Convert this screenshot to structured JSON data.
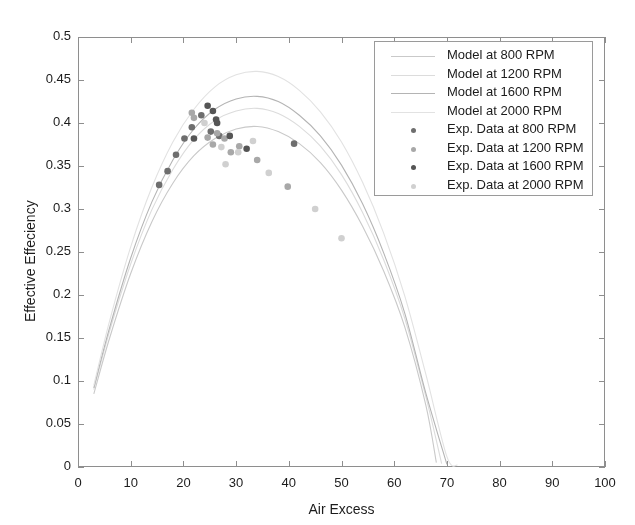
{
  "chart_data": {
    "type": "scatter",
    "title": "",
    "xlabel": "Air Excess",
    "ylabel": "Effective Effeciency",
    "xlim": [
      0,
      100
    ],
    "ylim": [
      0,
      0.5
    ],
    "grid": false,
    "xticks": [
      "0",
      "10",
      "20",
      "30",
      "40",
      "50",
      "60",
      "70",
      "80",
      "90",
      "100"
    ],
    "xtick_values": [
      0,
      10,
      20,
      30,
      40,
      50,
      60,
      70,
      80,
      90,
      100
    ],
    "yticks": [
      "0",
      "0.05",
      "0.1",
      "0.15",
      "0.2",
      "0.25",
      "0.3",
      "0.35",
      "0.4",
      "0.45",
      "0.5"
    ],
    "ytick_values": [
      0,
      0.05,
      0.1,
      0.15,
      0.2,
      0.25,
      0.3,
      0.35,
      0.4,
      0.45,
      0.5
    ],
    "legend_position": "top-right",
    "legend": [
      {
        "label": "Model at 800 RPM",
        "kind": "line",
        "color": "#c9c9c9"
      },
      {
        "label": "Model at 1200 RPM",
        "kind": "line",
        "color": "#dcdcdc"
      },
      {
        "label": "Model at 1600 RPM",
        "kind": "line",
        "color": "#b4b4b4"
      },
      {
        "label": "Model at 2000 RPM",
        "kind": "line",
        "color": "#e2e2e2"
      },
      {
        "label": "Exp. Data at 800 RPM",
        "kind": "marker",
        "color": "#6e6e6e"
      },
      {
        "label": "Exp. Data at 1200 RPM",
        "kind": "marker",
        "color": "#a8a8a8"
      },
      {
        "label": "Exp. Data at 1600 RPM",
        "kind": "marker",
        "color": "#555555"
      },
      {
        "label": "Exp. Data at 2000 RPM",
        "kind": "marker",
        "color": "#d0d0d0"
      }
    ],
    "series": [
      {
        "name": "Model at 800 RPM",
        "kind": "line",
        "color": "#c9c9c9",
        "x": [
          3,
          6,
          10,
          14,
          18,
          22,
          26,
          30,
          34,
          38,
          42,
          46,
          50,
          54,
          58,
          62,
          66,
          68
        ],
        "y": [
          0.085,
          0.15,
          0.225,
          0.285,
          0.33,
          0.362,
          0.382,
          0.393,
          0.396,
          0.39,
          0.376,
          0.354,
          0.322,
          0.28,
          0.228,
          0.163,
          0.072,
          0.005
        ]
      },
      {
        "name": "Model at 1200 RPM",
        "kind": "line",
        "color": "#dcdcdc",
        "x": [
          3,
          6,
          10,
          14,
          18,
          22,
          26,
          30,
          34,
          38,
          42,
          46,
          50,
          54,
          58,
          62,
          66,
          69
        ],
        "y": [
          0.09,
          0.158,
          0.236,
          0.299,
          0.346,
          0.381,
          0.403,
          0.414,
          0.417,
          0.411,
          0.396,
          0.373,
          0.34,
          0.296,
          0.241,
          0.173,
          0.082,
          0.004
        ]
      },
      {
        "name": "Model at 1600 RPM",
        "kind": "line",
        "color": "#b4b4b4",
        "x": [
          3,
          6,
          10,
          14,
          18,
          22,
          26,
          30,
          34,
          38,
          42,
          46,
          50,
          54,
          58,
          62,
          66,
          70
        ],
        "y": [
          0.092,
          0.162,
          0.243,
          0.308,
          0.357,
          0.393,
          0.416,
          0.428,
          0.431,
          0.425,
          0.409,
          0.385,
          0.351,
          0.306,
          0.249,
          0.179,
          0.086,
          0.003
        ]
      },
      {
        "name": "Model at 2000 RPM",
        "kind": "line",
        "color": "#e2e2e2",
        "x": [
          3,
          6,
          10,
          14,
          18,
          22,
          26,
          30,
          34,
          38,
          42,
          46,
          50,
          54,
          58,
          62,
          66,
          70,
          72
        ],
        "y": [
          0.095,
          0.17,
          0.256,
          0.325,
          0.378,
          0.416,
          0.442,
          0.456,
          0.46,
          0.454,
          0.438,
          0.413,
          0.378,
          0.331,
          0.272,
          0.199,
          0.108,
          0.012,
          0.002
        ]
      },
      {
        "name": "Exp. Data at 800 RPM",
        "kind": "scatter",
        "color": "#6e6e6e",
        "x": [
          15.4,
          17.0,
          18.6,
          20.2,
          21.6,
          23.4,
          25.2,
          26.8,
          41.0
        ],
        "y": [
          0.328,
          0.344,
          0.363,
          0.382,
          0.395,
          0.409,
          0.39,
          0.385,
          0.376
        ]
      },
      {
        "name": "Exp. Data at 1200 RPM",
        "kind": "scatter",
        "color": "#a8a8a8",
        "x": [
          21.6,
          22.0,
          24.6,
          25.6,
          26.4,
          27.8,
          29.0,
          30.6,
          34.0,
          39.8
        ],
        "y": [
          0.412,
          0.406,
          0.383,
          0.375,
          0.388,
          0.382,
          0.366,
          0.373,
          0.357,
          0.326
        ]
      },
      {
        "name": "Exp. Data at 1600 RPM",
        "kind": "scatter",
        "color": "#555555",
        "x": [
          22.0,
          24.6,
          25.6,
          26.2,
          26.4,
          28.8,
          32.0
        ],
        "y": [
          0.382,
          0.42,
          0.414,
          0.404,
          0.4,
          0.385,
          0.37
        ]
      },
      {
        "name": "Exp. Data at 2000 RPM",
        "kind": "scatter",
        "color": "#d0d0d0",
        "x": [
          24.0,
          27.2,
          28.0,
          30.4,
          33.2,
          36.2,
          45.0,
          50.0
        ],
        "y": [
          0.4,
          0.372,
          0.352,
          0.366,
          0.379,
          0.342,
          0.3,
          0.266
        ]
      }
    ]
  }
}
